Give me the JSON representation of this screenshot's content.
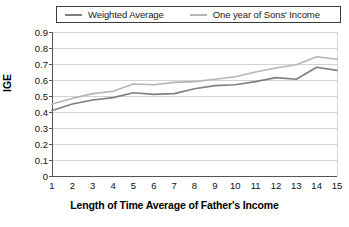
{
  "chart_data": {
    "type": "line",
    "title": "",
    "xlabel": "Length of Time Average of Father's Income",
    "ylabel": "IGE",
    "categories": [
      1,
      2,
      3,
      4,
      5,
      6,
      7,
      8,
      9,
      10,
      11,
      12,
      13,
      14,
      15
    ],
    "xticklabels": [
      "1",
      "2",
      "3",
      "4",
      "5",
      "6",
      "7",
      "8",
      "9",
      "10",
      "11",
      "12",
      "13",
      "14",
      "15"
    ],
    "yticklabels": [
      "0.9",
      "0.8",
      "0.7",
      "0.6",
      "0.5",
      "0.4",
      "0.3",
      "0.2",
      "0.1",
      "0"
    ],
    "ytickvalues": [
      0.9,
      0.8,
      0.7,
      0.6,
      0.5,
      0.4,
      0.3,
      0.2,
      0.1,
      0
    ],
    "ylim": [
      0,
      0.9
    ],
    "xlim": [
      1,
      15
    ],
    "grid": "horizontal",
    "legend_position": "top",
    "series": [
      {
        "name": "Weighted Average",
        "color": "#808080",
        "values": [
          0.41,
          0.45,
          0.475,
          0.49,
          0.52,
          0.51,
          0.515,
          0.545,
          0.565,
          0.57,
          0.59,
          0.615,
          0.605,
          0.68,
          0.66
        ]
      },
      {
        "name": "One year of Sons' Income",
        "color": "#b5b5b5",
        "values": [
          0.45,
          0.485,
          0.515,
          0.53,
          0.575,
          0.57,
          0.585,
          0.59,
          0.605,
          0.62,
          0.65,
          0.675,
          0.695,
          0.745,
          0.73
        ]
      }
    ]
  },
  "legend": {
    "entries": [
      {
        "label": "Weighted Average"
      },
      {
        "label": "One year of Sons' Income"
      }
    ]
  },
  "axes": {
    "y_title": "IGE",
    "x_title": "Length of Time Average of Father's Income"
  },
  "colors": {
    "weighted_average": "#808080",
    "one_year": "#b5b5b5",
    "grid": "#c8c8c8",
    "frame": "#8a8a8a",
    "axis": "#555555"
  }
}
